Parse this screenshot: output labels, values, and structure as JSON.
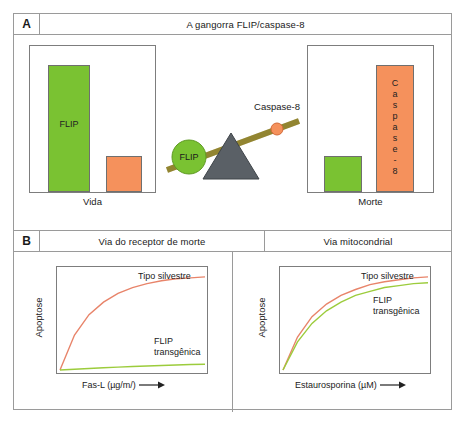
{
  "figure": {
    "panel_a": {
      "letter": "A",
      "title": "A gangorra FLIP/caspase-8",
      "left_chart": {
        "caption": "Vida",
        "green_bar_label": "FLIP",
        "orange_bar_label": ""
      },
      "right_chart": {
        "caption": "Morte",
        "green_bar_label": "",
        "orange_bar_label_letters": [
          "C",
          "a",
          "s",
          "p",
          "a",
          "s",
          "e",
          "-",
          "8"
        ],
        "orange_bar_label": "Caspase-8"
      },
      "seesaw": {
        "left_weight_label": "FLIP",
        "right_weight_label": "Caspase-8"
      }
    },
    "panel_b": {
      "letter": "B",
      "left_title": "Via do receptor de morte",
      "right_title": "Via mitocondrial",
      "left_chart": {
        "ylabel": "Apoptose",
        "xlabel": "Fas-L (µg/m/)",
        "series_labels": {
          "wildtype": "Tipo silvestre",
          "transgenic_line1": "FLIP",
          "transgenic_line2": "transgênica"
        }
      },
      "right_chart": {
        "ylabel": "Apoptose",
        "xlabel": "Estaurosporina (µM)",
        "series_labels": {
          "wildtype": "Tipo silvestre",
          "transgenic_line1": "FLIP",
          "transgenic_line2": "transgênica"
        }
      }
    }
  },
  "colors": {
    "green": "#7ac232",
    "orange": "#f5915c",
    "curve_wildtype": "#e8846a",
    "curve_transgenic": "#9ccc3c",
    "beam": "#9a8c34",
    "fulcrum": "#5a6066",
    "border": "#9a9a9a"
  },
  "chart_data": [
    {
      "type": "bar",
      "title": "Vida",
      "categories": [
        "FLIP",
        "Caspase-8"
      ],
      "values": [
        100,
        28
      ],
      "colors": [
        "#7ac232",
        "#f5915c"
      ],
      "xlabel": "Vida",
      "ylabel": "",
      "ylim": [
        0,
        115
      ],
      "grid": false,
      "legend": "none",
      "annotations": [
        "FLIP"
      ]
    },
    {
      "type": "bar",
      "title": "Morte",
      "categories": [
        "FLIP",
        "Caspase-8"
      ],
      "values": [
        28,
        100
      ],
      "colors": [
        "#7ac232",
        "#f5915c"
      ],
      "xlabel": "Morte",
      "ylabel": "",
      "ylim": [
        0,
        115
      ],
      "grid": false,
      "legend": "none",
      "annotations": [
        "Caspase-8"
      ]
    },
    {
      "type": "line",
      "title": "Via do receptor de morte",
      "xlabel": "Fas-L (µg/m/)",
      "ylabel": "Apoptose",
      "x": [
        0,
        0.1,
        0.2,
        0.3,
        0.4,
        0.5,
        0.6,
        0.7,
        0.8,
        0.9,
        1.0
      ],
      "series": [
        {
          "name": "Tipo silvestre",
          "color": "#e8846a",
          "values": [
            0,
            36,
            57,
            70,
            79,
            85,
            89,
            92,
            94,
            95,
            96
          ]
        },
        {
          "name": "FLIP transgênica",
          "color": "#9ccc3c",
          "values": [
            0,
            0.8,
            1.6,
            2.3,
            3.0,
            3.6,
            4.2,
            4.7,
            5.2,
            5.6,
            6.0
          ]
        }
      ],
      "ylim": [
        0,
        100
      ],
      "xlim": [
        0,
        1
      ],
      "grid": false,
      "legend": "inline-right",
      "axis_arrow": true
    },
    {
      "type": "line",
      "title": "Via mitocondrial",
      "xlabel": "Estaurosporina (µM)",
      "ylabel": "Apoptose",
      "x": [
        0,
        0.1,
        0.2,
        0.3,
        0.4,
        0.5,
        0.6,
        0.7,
        0.8,
        0.9,
        1.0
      ],
      "series": [
        {
          "name": "Tipo silvestre",
          "color": "#e8846a",
          "values": [
            0,
            34,
            55,
            68,
            77,
            83,
            88,
            91,
            93,
            95,
            96
          ]
        },
        {
          "name": "FLIP transgênica",
          "color": "#9ccc3c",
          "values": [
            0,
            29,
            48,
            61,
            70,
            77,
            81,
            85,
            87,
            89,
            90
          ]
        }
      ],
      "ylim": [
        0,
        100
      ],
      "xlim": [
        0,
        1
      ],
      "grid": false,
      "legend": "inline-right",
      "axis_arrow": true
    }
  ]
}
